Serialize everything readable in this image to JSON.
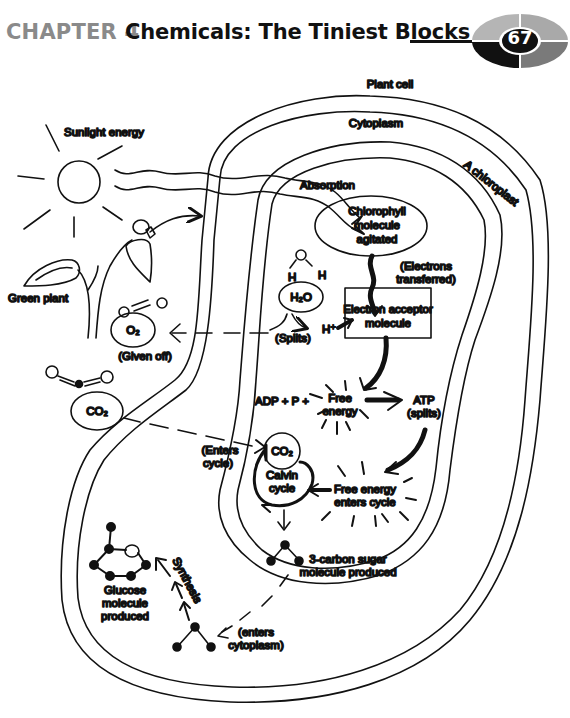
{
  "header": {
    "chapter": "CHAPTER 4",
    "title": "Chemicals: The Tiniest Blocks",
    "page_number": "67"
  },
  "diagram": {
    "labels": {
      "plant_cell": "Plant cell",
      "cytoplasm": "Cytoplasm",
      "chloroplast": "A chloroplast",
      "sunlight": "Sunlight energy",
      "absorption": "Absorption",
      "chlorophyll": [
        "Chlorophyll",
        "molecule",
        "agitated"
      ],
      "electrons": [
        "(Electrons",
        "transferred)"
      ],
      "green_plant": "Green plant",
      "h_left": "H",
      "h_right": "H",
      "h2o": "H₂O",
      "splits": "(Splits)",
      "h_plus": "H⁺",
      "electron_acceptor": [
        "Electron acceptor",
        "molecule"
      ],
      "o2": "O₂",
      "given_off": "(Given off)",
      "co2_outside": "CO₂",
      "adp": "ADP + P +",
      "free_energy": [
        "Free",
        "energy"
      ],
      "atp": [
        "ATP",
        "(splits)"
      ],
      "enters_cycle": [
        "(Enters",
        "cycle)"
      ],
      "co2_cycle": "CO₂",
      "calvin": [
        "Calvin",
        "cycle"
      ],
      "free_energy_enters": [
        "Free energy",
        "enters cycle"
      ],
      "three_carbon": [
        "3-carbon sugar",
        "molecule produced"
      ],
      "glucose": [
        "Glucose",
        "molecule",
        "produced"
      ],
      "synthesis": "Synthesis",
      "enters_cytoplasm": [
        "(enters",
        "cytoplasm)"
      ]
    }
  },
  "colors": {
    "chapter_gray": "#8a8a8a",
    "title_black": "#111111",
    "badge_light": "#b5b5b5",
    "badge_mid": "#7a7a7a",
    "badge_dark": "#111111"
  }
}
